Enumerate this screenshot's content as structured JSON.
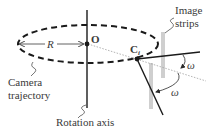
{
  "diagram": {
    "type": "camera-rotation-geometry",
    "labels": {
      "image_strips_line1": "Image",
      "image_strips_line2": "strips",
      "radius": "R",
      "center": "O",
      "camera_point": "C",
      "camera_point_subscript": "i",
      "angle_upper": "ω",
      "angle_lower": "ω",
      "camera_trajectory_line1": "Camera",
      "camera_trajectory_line2": "trajectory",
      "rotation_axis": "Rotation axis"
    },
    "colors": {
      "ink": "#1a1a1a",
      "text": "#3a3a3a",
      "strip": "#cfcfcf",
      "dotted": "#a0a0a0",
      "background": "#ffffff"
    }
  }
}
